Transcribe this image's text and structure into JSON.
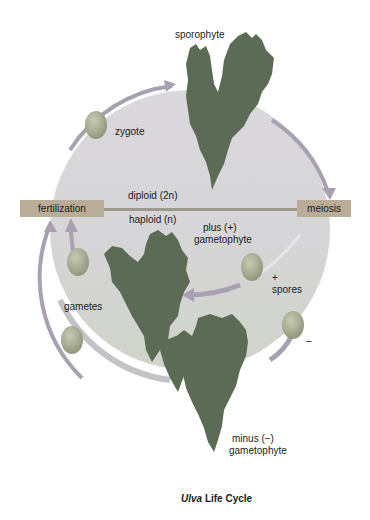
{
  "title": {
    "italic": "Ulva",
    "rest": " Life Cycle"
  },
  "labels": {
    "sporophyte": "sporophyte",
    "zygote": "zygote",
    "diploid": "diploid (2n)",
    "haploid": "haploid (n)",
    "fertilization": "fertilization",
    "meiosis": "meiosis",
    "plus_gametophyte_1": "plus (+)",
    "plus_gametophyte_2": "gametophyte",
    "plus_sign": "+",
    "spores": "spores",
    "minus_sign": "–",
    "gametes": "gametes",
    "minus_gametophyte_1": "minus (−)",
    "minus_gametophyte_2": "gametophyte"
  },
  "colors": {
    "circle_top": "#d8d6da",
    "circle_bottom": "#d2d6cc",
    "ring": "#b9b4c0",
    "leaf": "#5c6b55",
    "arrow": "#a9a0b2",
    "bar": "#b9ad97",
    "divider": "#9c9a8c",
    "cell": "#a4a88e"
  }
}
